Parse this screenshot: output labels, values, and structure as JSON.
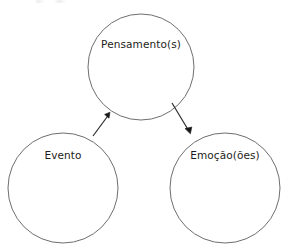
{
  "diagram": {
    "title": "",
    "background_color": "#ffffff",
    "node_stroke_color": "#6e6e72",
    "node_fill_color": "#ffffff",
    "label_color": "#1d1d20",
    "edge_color": "#17171a",
    "nodes": [
      {
        "id": "pensamentos",
        "label": "Pensamento(s)",
        "cx": 141,
        "cy": 67,
        "r": 53,
        "label_x": 141,
        "label_y": 44
      },
      {
        "id": "evento",
        "label": "Evento",
        "cx": 63,
        "cy": 188,
        "r": 55,
        "label_x": 63,
        "label_y": 155
      },
      {
        "id": "emocoes",
        "label": "Emoção(ões)",
        "cx": 225,
        "cy": 188,
        "r": 55,
        "label_x": 225,
        "label_y": 155
      }
    ],
    "edges": [
      {
        "id": "evento-to-pensamentos",
        "from": "evento",
        "to": "pensamentos",
        "label": "",
        "x1": 93,
        "y1": 136,
        "x2": 110,
        "y2": 113
      },
      {
        "id": "pensamentos-to-emocoes",
        "from": "pensamentos",
        "to": "emocoes",
        "label": "",
        "x1": 172,
        "y1": 103,
        "x2": 190,
        "y2": 133
      }
    ]
  }
}
